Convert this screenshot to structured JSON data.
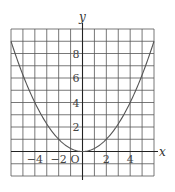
{
  "chart_data": {
    "type": "line",
    "title": "",
    "function": "y = x^2 / 4",
    "xlabel": "x",
    "ylabel": "y",
    "origin_label": "O",
    "xlim": [
      -6,
      6
    ],
    "ylim": [
      -2,
      10
    ],
    "grid": true,
    "grid_step": 1,
    "x_ticks": [
      -4,
      -2,
      2,
      4
    ],
    "x_tick_labels": [
      "−4",
      "−2",
      "2",
      "4"
    ],
    "y_ticks": [
      2,
      4,
      6,
      8
    ],
    "y_tick_labels": [
      "2",
      "4",
      "6",
      "8"
    ],
    "series": [
      {
        "name": "y = x²/4",
        "x": [
          -6,
          -5,
          -4,
          -3,
          -2,
          -1,
          0,
          1,
          2,
          3,
          4,
          5,
          6
        ],
        "y": [
          9,
          6.25,
          4,
          2.25,
          1,
          0.25,
          0,
          0.25,
          1,
          2.25,
          4,
          6.25,
          9
        ]
      }
    ]
  }
}
